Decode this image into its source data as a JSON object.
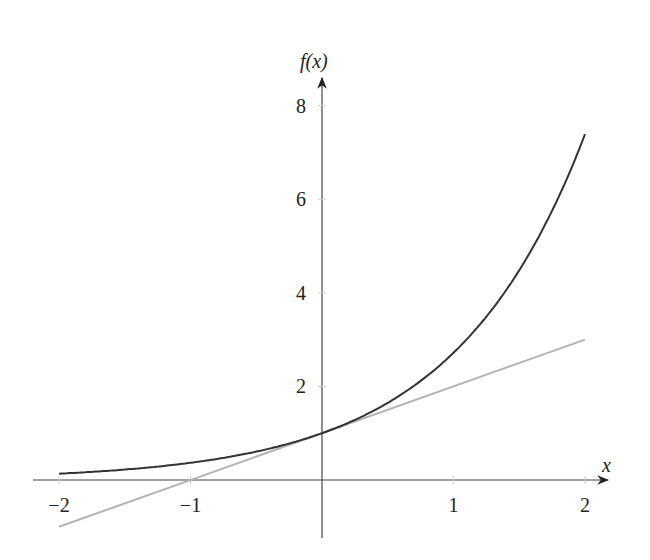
{
  "chart_data": {
    "type": "line",
    "title": "",
    "xlabel": "x",
    "ylabel": "f(x)",
    "xlim": [
      -2,
      2
    ],
    "ylim": [
      0,
      8
    ],
    "x_ticks": [
      "−2",
      "−1",
      "1",
      "2"
    ],
    "y_ticks": [
      "2",
      "4",
      "6",
      "8"
    ],
    "grid": false,
    "legend": null,
    "series": [
      {
        "name": "f(x) = e^x",
        "color": "#333333",
        "x": [
          -2,
          -1.5,
          -1,
          -0.5,
          0,
          0.5,
          1,
          1.5,
          2
        ],
        "values": [
          0.135,
          0.223,
          0.368,
          0.607,
          1,
          1.649,
          2.718,
          4.482,
          7.389
        ]
      },
      {
        "name": "tangent y = x + 1",
        "color": "#b0b0b0",
        "x": [
          -2,
          2
        ],
        "values": [
          -1,
          3
        ]
      }
    ]
  }
}
